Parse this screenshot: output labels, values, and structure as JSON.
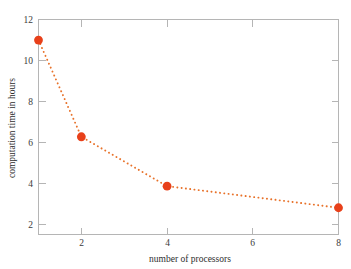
{
  "chart_data": {
    "type": "line",
    "title": "",
    "xlabel": "number of processors",
    "ylabel": "computation time in hours",
    "x": [
      1,
      2,
      4,
      8
    ],
    "values": [
      11.0,
      6.3,
      3.9,
      2.85
    ],
    "series": [
      {
        "name": "computation time",
        "x": [
          1,
          2,
          4,
          8
        ],
        "values": [
          11.0,
          6.3,
          3.9,
          2.85
        ]
      }
    ],
    "xlim": [
      1,
      8
    ],
    "ylim": [
      1.55,
      12.0
    ],
    "xticks": [
      2,
      4,
      6,
      8
    ],
    "xtick_labels": [
      "2",
      "4",
      "6",
      "8"
    ],
    "yticks": [
      2,
      4,
      6,
      8,
      10,
      12
    ],
    "ytick_labels": [
      "2",
      "4",
      "6",
      "8",
      "10",
      "12"
    ],
    "grid": false,
    "legend": "none",
    "line_style": "dotted",
    "marker": "circle",
    "marker_color": "#E8401A",
    "line_color": "#E8722A",
    "axis_color": "#B5B5B5",
    "background_color": "#FFFFFF"
  },
  "axes": {
    "x_title": "number of processors",
    "y_title": "computation time in hours"
  },
  "ticks": {
    "x": [
      {
        "label": "2",
        "value": 2
      },
      {
        "label": "4",
        "value": 4
      },
      {
        "label": "6",
        "value": 6
      },
      {
        "label": "8",
        "value": 8
      }
    ],
    "y": [
      {
        "label": "2",
        "value": 2
      },
      {
        "label": "4",
        "value": 4
      },
      {
        "label": "6",
        "value": 6
      },
      {
        "label": "8",
        "value": 8
      },
      {
        "label": "10",
        "value": 10
      },
      {
        "label": "12",
        "value": 12
      }
    ]
  }
}
